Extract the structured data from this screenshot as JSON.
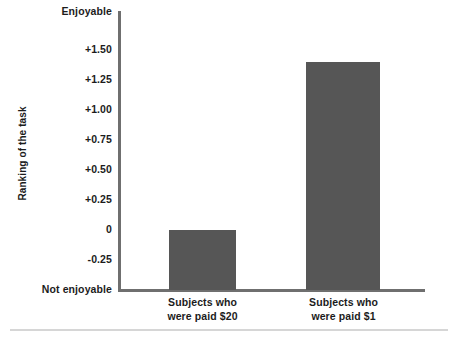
{
  "chart_data": {
    "type": "bar",
    "title": "",
    "xlabel": "",
    "ylabel": "Ranking of the task",
    "categories": [
      "Subjects who were paid $20",
      "Subjects who were paid $1"
    ],
    "values": [
      0,
      1.4
    ],
    "ylim": [
      -0.5,
      1.75
    ],
    "yticks": [
      1.5,
      1.25,
      1.0,
      0.75,
      0.5,
      0.25,
      0,
      -0.25
    ],
    "ytick_labels": [
      "+1.50",
      "+1.25",
      "+1.00",
      "+0.75",
      "+0.50",
      "+0.25",
      "0",
      "-0.25"
    ],
    "axis_top_label": "Enjoyable",
    "axis_bottom_label": "Not enjoyable",
    "grid": false,
    "legend": null,
    "bar_color": "#565656",
    "axis_color": "#6f6f6f"
  },
  "axis": {
    "y_title": "Ranking of the task",
    "top_label": "Enjoyable",
    "bottom_label": "Not enjoyable",
    "ticks": [
      {
        "label": "+1.50"
      },
      {
        "label": "+1.25"
      },
      {
        "label": "+1.00"
      },
      {
        "label": "+0.75"
      },
      {
        "label": "+0.50"
      },
      {
        "label": "+0.25"
      },
      {
        "label": "0"
      },
      {
        "label": "-0.25"
      }
    ]
  },
  "bars": [
    {
      "line1": "Subjects who",
      "line2": "were paid $20"
    },
    {
      "line1": "Subjects who",
      "line2": "were paid $1"
    }
  ]
}
